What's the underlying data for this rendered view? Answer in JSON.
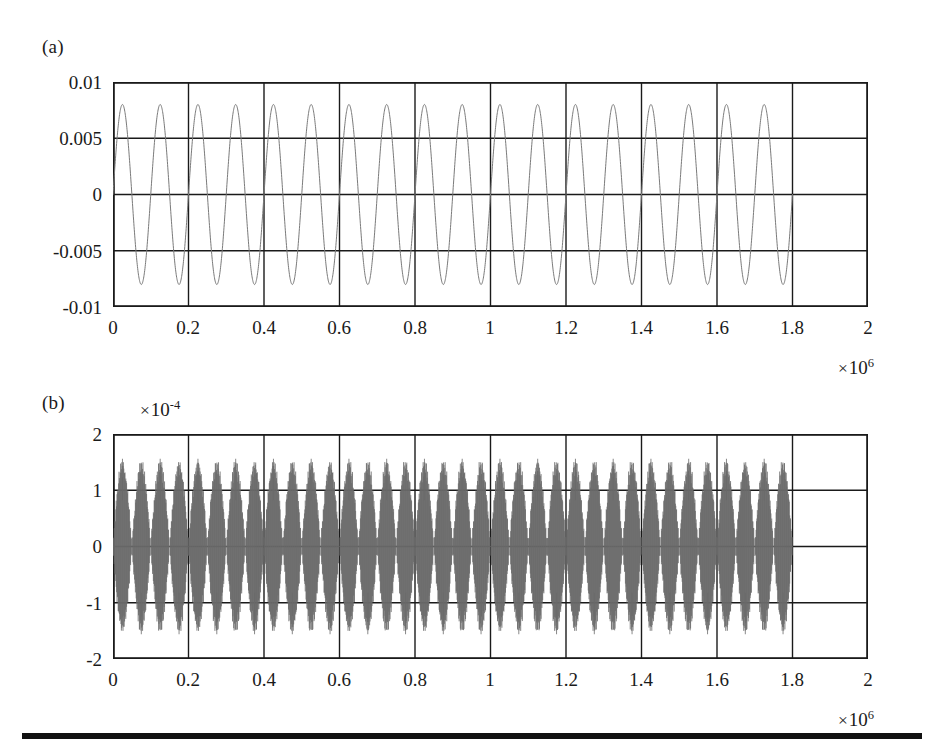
{
  "figure": {
    "background": "#ffffff",
    "axis_color": "#1a1a1a",
    "trace_color_a": "#7a7a7a",
    "trace_color_b": "#6a6a6a",
    "panels": [
      {
        "id": "a",
        "label": "(a)"
      },
      {
        "id": "b",
        "label": "(b)"
      }
    ]
  },
  "panel_a": {
    "label": "(a)",
    "y_ticks": [
      "0.01",
      "0.005",
      "0",
      "-0.005",
      "-0.01"
    ],
    "x_ticks": [
      "0",
      "0.2",
      "0.4",
      "0.6",
      "0.8",
      "1",
      "1.2",
      "1.4",
      "1.6",
      "1.8",
      "2"
    ],
    "x_multiplier": {
      "times": "×",
      "base": "10",
      "exponent": "6"
    }
  },
  "panel_b": {
    "label": "(b)",
    "y_ticks": [
      "2",
      "1",
      "0",
      "-1",
      "-2"
    ],
    "y_multiplier": {
      "times": "×",
      "base": "10",
      "exponent": "-4"
    },
    "x_ticks": [
      "0",
      "0.2",
      "0.4",
      "0.6",
      "0.8",
      "1",
      "1.2",
      "1.4",
      "1.6",
      "1.8",
      "2"
    ],
    "x_multiplier": {
      "times": "×",
      "base": "10",
      "exponent": "6"
    }
  },
  "chart_data": [
    {
      "type": "line",
      "panel": "a",
      "title": "(a)",
      "xlabel": "",
      "ylabel": "",
      "xlim": [
        0,
        2000000
      ],
      "ylim": [
        -0.01,
        0.01
      ],
      "x_tick_values": [
        0,
        200000,
        400000,
        600000,
        800000,
        1000000,
        1200000,
        1400000,
        1600000,
        1800000,
        2000000
      ],
      "y_tick_values": [
        0.01,
        0.005,
        0,
        -0.005,
        -0.01
      ],
      "x_tick_labels": [
        "0",
        "0.2",
        "0.4",
        "0.6",
        "0.8",
        "1",
        "1.2",
        "1.4",
        "1.6",
        "1.8",
        "2"
      ],
      "y_tick_labels": [
        "0.01",
        "0.005",
        "0",
        "-0.005",
        "-0.01"
      ],
      "x_scale_multiplier": 1000000,
      "x_scale_label": "× 10^6",
      "grid": true,
      "grid_x_divisions": 10,
      "grid_y_divisions": 4,
      "legend": "none",
      "series": [
        {
          "name": "output voltage",
          "waveform": "sine",
          "amplitude": 0.008,
          "offset": 0.0,
          "period": 100000,
          "cycles": 18,
          "data_x_start": 0,
          "data_x_end": 1800000,
          "phase_deg": 0,
          "color": "#7a7a7a",
          "linewidth": 1
        }
      ],
      "notes": "Clean sinusoid, 18 full cycles spanning 0 to 1.8e6; last grid division (1.8e6-2e6) empty."
    },
    {
      "type": "line",
      "panel": "b",
      "title": "(b)",
      "xlabel": "",
      "ylabel": "",
      "xlim": [
        0,
        2000000
      ],
      "ylim": [
        -0.0002,
        0.0002
      ],
      "x_tick_values": [
        0,
        200000,
        400000,
        600000,
        800000,
        1000000,
        1200000,
        1400000,
        1600000,
        1800000,
        2000000
      ],
      "y_tick_values": [
        0.0002,
        0.0001,
        0,
        -0.0001,
        -0.0002
      ],
      "x_tick_labels": [
        "0",
        "0.2",
        "0.4",
        "0.6",
        "0.8",
        "1",
        "1.2",
        "1.4",
        "1.6",
        "1.8",
        "2"
      ],
      "y_tick_labels": [
        "2",
        "1",
        "0",
        "-1",
        "-2"
      ],
      "x_scale_multiplier": 1000000,
      "x_scale_label": "× 10^6",
      "y_scale_multiplier": 0.0001,
      "y_scale_label": "× 10^-4",
      "grid": true,
      "grid_x_divisions": 10,
      "grid_y_divisions": 4,
      "legend": "none",
      "series": [
        {
          "name": "quantization error",
          "waveform": "amplitude-modulated-carrier",
          "envelope": "staircase-sine",
          "envelope_amplitude": 0.00015,
          "envelope_period": 100000,
          "envelope_steps": 9,
          "carrier_cycles_per_envelope": 60,
          "bursts": 18,
          "data_x_start": 0,
          "data_x_end": 1800000,
          "color": "#6a6a6a",
          "linewidth": 1
        }
      ],
      "notes": "Dense high-frequency trace amplitude-modulated by a quantized (staircase) sinusoid, peak about 1.5e-4; 18 bursts aligned with panel (a) cycles; last grid division empty."
    }
  ]
}
